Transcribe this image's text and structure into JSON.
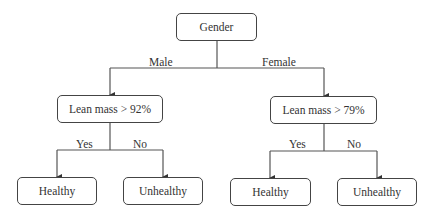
{
  "diagram": {
    "type": "decision-tree",
    "root": {
      "label": "Gender"
    },
    "branches": [
      {
        "edge_label": "Male",
        "node": {
          "label": "Lean mass > 92%"
        },
        "children": [
          {
            "edge_label": "Yes",
            "label": "Healthy"
          },
          {
            "edge_label": "No",
            "label": "Unhealthy"
          }
        ]
      },
      {
        "edge_label": "Female",
        "node": {
          "label": "Lean mass > 79%"
        },
        "children": [
          {
            "edge_label": "Yes",
            "label": "Healthy"
          },
          {
            "edge_label": "No",
            "label": "Unhealthy"
          }
        ]
      }
    ],
    "line_color": "#444444"
  }
}
